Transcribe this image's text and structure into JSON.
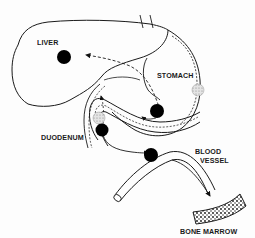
{
  "diagram": {
    "labels": {
      "liver": "LIVER",
      "stomach": "STOMACH",
      "duodenum": "DUODENUM",
      "blood_vessel_line1": "BLOOD",
      "blood_vessel_line2": "VESSEL",
      "bone_marrow": "BONE MARROW"
    },
    "nodes": [
      {
        "id": "liver-dot",
        "fill": "solid",
        "color": "#000000"
      },
      {
        "id": "stomach-dot",
        "fill": "solid",
        "color": "#000000"
      },
      {
        "id": "stomach-wall-dot",
        "fill": "stippled",
        "color": "#bbbbbb"
      },
      {
        "id": "duodenum-stippled-dot",
        "fill": "stippled",
        "color": "#bbbbbb"
      },
      {
        "id": "duodenum-dot",
        "fill": "solid",
        "color": "#000000"
      },
      {
        "id": "vessel-dot",
        "fill": "solid",
        "color": "#000000"
      }
    ],
    "colors": {
      "line": "#1a1a1a",
      "background": "#fdfdfd"
    }
  }
}
